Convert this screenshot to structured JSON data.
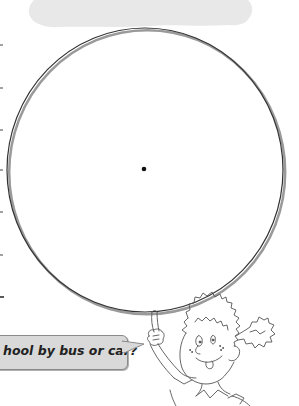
{
  "header_cloud": {
    "color": "#e6e6e6"
  },
  "diagram": {
    "type": "blank-circle",
    "circle_stroke": "#333333",
    "center_dot": true
  },
  "left_margin": {
    "tick_count": 7
  },
  "speech_bubble": {
    "text": "hool by bus or car?",
    "fill": "#d9d9d9",
    "border": "#8a8a8a"
  },
  "illustration": {
    "subject": "cartoon-child-pointing-up"
  }
}
